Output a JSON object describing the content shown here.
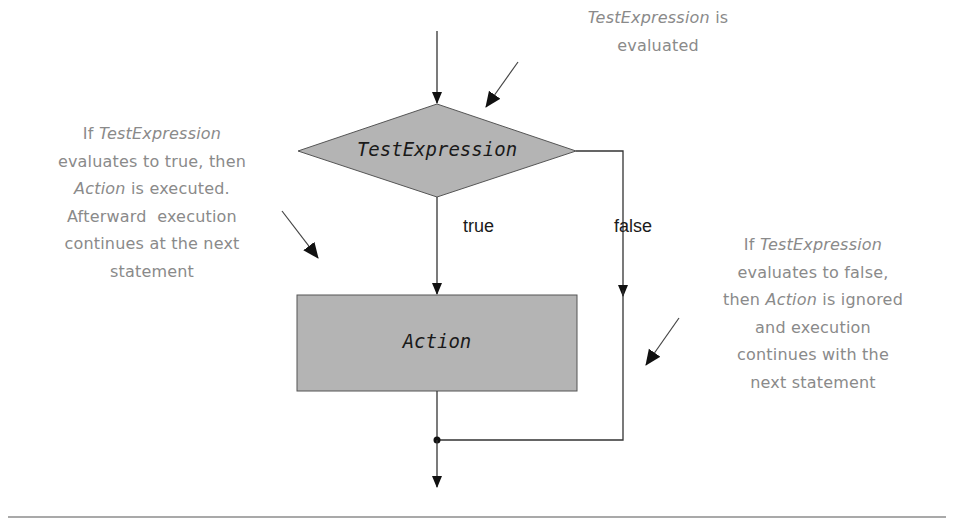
{
  "diagram": {
    "type": "flowchart",
    "colors": {
      "node_fill": "#b4b4b4",
      "node_stroke": "#555555",
      "edge": "#333333",
      "annotation_text": "#8a8a8a",
      "rule": "#8c8c8c"
    },
    "nodes": {
      "decision": {
        "label": "TestExpression",
        "shape": "diamond"
      },
      "action": {
        "label": "Action",
        "shape": "rectangle"
      }
    },
    "edges": {
      "true_label": "true",
      "false_label": "false"
    },
    "annotations": {
      "top": {
        "line1_em": "TestExpression",
        "line1_rest": " is",
        "line2": "evaluated"
      },
      "left": {
        "line1_pre": "If ",
        "line1_em": "TestExpression",
        "line2": "evaluates to true, then",
        "line3_em": "Action",
        "line3_rest": " is executed.",
        "line4": "Afterward  execution",
        "line5": "continues at the next",
        "line6": "statement"
      },
      "right": {
        "line1_pre": "If ",
        "line1_em": "TestExpression",
        "line2": "evaluates to false,",
        "line3_pre": "then ",
        "line3_em": "Action",
        "line3_rest": " is ignored",
        "line4": "and execution",
        "line5": "continues with the",
        "line6": "next statement"
      }
    }
  }
}
